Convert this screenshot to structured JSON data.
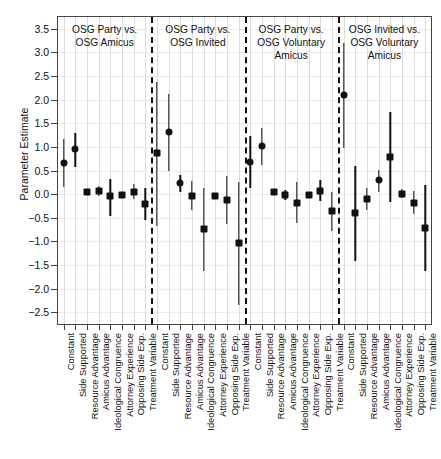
{
  "chart_data": {
    "type": "scatter",
    "title": "",
    "xlabel": "",
    "ylabel": "Parameter Estimate",
    "ylim": [
      -2.75,
      3.75
    ],
    "yticks": [
      3.5,
      3.0,
      2.5,
      2.0,
      1.5,
      1.0,
      0.5,
      0.0,
      -0.5,
      -1.0,
      -1.5,
      -2.0,
      -2.5
    ],
    "ytick_labels": [
      "3.5",
      "3.0",
      "2.5",
      "2.0",
      "1.5",
      "1.0",
      "0.5",
      "0.0",
      "−0.5",
      "−1.0",
      "−1.5",
      "−2.0",
      "−2.5"
    ],
    "grid": "vertical-dotted-per-term",
    "legend": "none",
    "marker_note": "circle = constant/side-supported style points, square = remaining coefficient points; vertical bar = confidence interval",
    "terms": [
      "Constant",
      "Side Supported",
      "Resource Advantage",
      "Amicus Advantage",
      "Ideological Congruence",
      "Attorney Experience",
      "Opposing Side Exp.",
      "Treatment Variable"
    ],
    "groups": [
      {
        "label": "OSG Party vs.\nOSG Amicus",
        "points": [
          {
            "term": "Constant",
            "estimate": 0.65,
            "lower": 0.15,
            "upper": 1.17,
            "marker": "circle"
          },
          {
            "term": "Side Supported",
            "estimate": 0.95,
            "lower": 0.58,
            "upper": 1.3,
            "marker": "circle"
          },
          {
            "term": "Resource Advantage",
            "estimate": 0.04,
            "lower": -0.02,
            "upper": 0.1,
            "marker": "square"
          },
          {
            "term": "Amicus Advantage",
            "estimate": 0.07,
            "lower": -0.03,
            "upper": 0.17,
            "marker": "square"
          },
          {
            "term": "Ideological Congruence",
            "estimate": -0.05,
            "lower": -0.47,
            "upper": 0.31,
            "marker": "square"
          },
          {
            "term": "Attorney Experience",
            "estimate": -0.01,
            "lower": -0.05,
            "upper": 0.03,
            "marker": "square"
          },
          {
            "term": "Opposing Side Exp.",
            "estimate": 0.05,
            "lower": -0.1,
            "upper": 0.21,
            "marker": "square"
          },
          {
            "term": "Treatment Variable",
            "estimate": -0.2,
            "lower": -0.55,
            "upper": 0.12,
            "marker": "square"
          }
        ]
      },
      {
        "label": "OSG Party vs.\nOSG Invited",
        "points": [
          {
            "term": "Constant",
            "estimate": 0.86,
            "lower": -0.67,
            "upper": 2.38,
            "marker": "square"
          },
          {
            "term": "Side Supported",
            "estimate": 1.31,
            "lower": 0.49,
            "upper": 2.13,
            "marker": "circle"
          },
          {
            "term": "Resource Advantage",
            "estimate": 0.23,
            "lower": 0.05,
            "upper": 0.41,
            "marker": "circle"
          },
          {
            "term": "Amicus Advantage",
            "estimate": -0.03,
            "lower": -0.34,
            "upper": 0.27,
            "marker": "square"
          },
          {
            "term": "Ideological Congruence",
            "estimate": -0.74,
            "lower": -1.62,
            "upper": 0.14,
            "marker": "square"
          },
          {
            "term": "Attorney Experience",
            "estimate": -0.04,
            "lower": -0.1,
            "upper": 0.02,
            "marker": "square"
          },
          {
            "term": "Opposing Side Exp.",
            "estimate": -0.13,
            "lower": -0.64,
            "upper": 0.39,
            "marker": "square"
          },
          {
            "term": "Treatment Variable",
            "estimate": -1.03,
            "lower": -2.34,
            "upper": 0.25,
            "marker": "square"
          }
        ]
      },
      {
        "label": "OSG Party vs.\nOSG Voluntary\nAmicus",
        "points": [
          {
            "term": "Constant",
            "estimate": 0.69,
            "lower": 0.12,
            "upper": 1.24,
            "marker": "circle"
          },
          {
            "term": "Side Supported",
            "estimate": 1.02,
            "lower": 0.62,
            "upper": 1.4,
            "marker": "circle"
          },
          {
            "term": "Resource Advantage",
            "estimate": 0.05,
            "lower": -0.01,
            "upper": 0.11,
            "marker": "square"
          },
          {
            "term": "Amicus Advantage",
            "estimate": -0.02,
            "lower": -0.12,
            "upper": 0.08,
            "marker": "square"
          },
          {
            "term": "Ideological Congruence",
            "estimate": -0.19,
            "lower": -0.62,
            "upper": 0.26,
            "marker": "square"
          },
          {
            "term": "Attorney Experience",
            "estimate": -0.02,
            "lower": -0.06,
            "upper": 0.02,
            "marker": "square"
          },
          {
            "term": "Opposing Side Exp.",
            "estimate": 0.06,
            "lower": -0.14,
            "upper": 0.3,
            "marker": "square"
          },
          {
            "term": "Treatment Variable",
            "estimate": -0.36,
            "lower": -0.78,
            "upper": 0.05,
            "marker": "square"
          }
        ]
      },
      {
        "label": "OSG Invited vs.\nOSG Voluntary\nAmicus",
        "points": [
          {
            "term": "Constant",
            "estimate": 2.09,
            "lower": 0.98,
            "upper": 3.2,
            "marker": "circle"
          },
          {
            "term": "Side Supported",
            "estimate": -0.41,
            "lower": -1.41,
            "upper": 0.6,
            "marker": "square"
          },
          {
            "term": "Resource Advantage",
            "estimate": -0.11,
            "lower": -0.33,
            "upper": 0.12,
            "marker": "square"
          },
          {
            "term": "Amicus Advantage",
            "estimate": 0.29,
            "lower": 0.04,
            "upper": 0.51,
            "marker": "circle"
          },
          {
            "term": "Ideological Congruence",
            "estimate": 0.79,
            "lower": -0.16,
            "upper": 1.74,
            "marker": "square"
          },
          {
            "term": "Attorney Experience",
            "estimate": 0.01,
            "lower": -0.09,
            "upper": 0.11,
            "marker": "square"
          },
          {
            "term": "Opposing Side Exp.",
            "estimate": -0.18,
            "lower": -0.43,
            "upper": 0.07,
            "marker": "square"
          },
          {
            "term": "Treatment Variable",
            "estimate": -0.71,
            "lower": -1.62,
            "upper": 0.2,
            "marker": "square"
          }
        ]
      }
    ]
  }
}
